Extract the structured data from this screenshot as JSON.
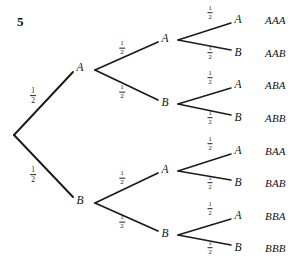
{
  "diagram": {
    "problem_number": "5",
    "type": "probability-tree",
    "branch_probability": {
      "numerator": "1",
      "denominator": "2"
    },
    "root": {
      "x": 14,
      "y": 135
    },
    "levels": [
      {
        "level": 1,
        "nodes": [
          {
            "id": "A",
            "label": "A",
            "x": 80,
            "y": 68,
            "vertex_x": 95,
            "vertex_y": 70,
            "prob_x": 33,
            "prob_y": 96,
            "frac_size": "frac-lg"
          },
          {
            "id": "B",
            "label": "B",
            "x": 80,
            "y": 201,
            "vertex_x": 95,
            "vertex_y": 203,
            "prob_x": 33,
            "prob_y": 175,
            "frac_size": "frac-lg"
          }
        ]
      },
      {
        "level": 2,
        "nodes": [
          {
            "id": "AA",
            "label": "A",
            "x": 165,
            "y": 39,
            "vertex_x": 178,
            "vertex_y": 40,
            "parent_x": 95,
            "parent_y": 70,
            "prob_x": 122,
            "prob_y": 48,
            "frac_size": "frac-md"
          },
          {
            "id": "AB",
            "label": "B",
            "x": 165,
            "y": 103,
            "vertex_x": 178,
            "vertex_y": 104,
            "parent_x": 95,
            "parent_y": 70,
            "prob_x": 122,
            "prob_y": 92,
            "frac_size": "frac-md"
          },
          {
            "id": "BA",
            "label": "A",
            "x": 165,
            "y": 170,
            "vertex_x": 178,
            "vertex_y": 171,
            "parent_x": 95,
            "parent_y": 203,
            "prob_x": 122,
            "prob_y": 178,
            "frac_size": "frac-md"
          },
          {
            "id": "BB",
            "label": "B",
            "x": 165,
            "y": 234,
            "vertex_x": 178,
            "vertex_y": 235,
            "parent_x": 95,
            "parent_y": 203,
            "prob_x": 122,
            "prob_y": 222,
            "frac_size": "frac-md"
          }
        ]
      },
      {
        "level": 3,
        "nodes": [
          {
            "id": "AAA",
            "label": "A",
            "x": 238,
            "y": 20,
            "parent_x": 178,
            "parent_y": 40,
            "prob_x": 210,
            "prob_y": 13,
            "frac_size": "frac-sm",
            "outcome": "AAA",
            "outcome_x": 265,
            "outcome_y": 20
          },
          {
            "id": "AAB",
            "label": "B",
            "x": 238,
            "y": 53,
            "parent_x": 178,
            "parent_y": 40,
            "prob_x": 210,
            "prob_y": 53,
            "frac_size": "frac-sm",
            "outcome": "AAB",
            "outcome_x": 265,
            "outcome_y": 53
          },
          {
            "id": "ABA",
            "label": "A",
            "x": 238,
            "y": 85,
            "parent_x": 178,
            "parent_y": 104,
            "prob_x": 210,
            "prob_y": 78,
            "frac_size": "frac-sm",
            "outcome": "ABA",
            "outcome_x": 265,
            "outcome_y": 85
          },
          {
            "id": "ABB",
            "label": "B",
            "x": 238,
            "y": 118,
            "parent_x": 178,
            "parent_y": 104,
            "prob_x": 210,
            "prob_y": 118,
            "frac_size": "frac-sm",
            "outcome": "ABB",
            "outcome_x": 265,
            "outcome_y": 118
          },
          {
            "id": "BAA",
            "label": "A",
            "x": 238,
            "y": 151,
            "parent_x": 178,
            "parent_y": 171,
            "prob_x": 210,
            "prob_y": 144,
            "frac_size": "frac-sm",
            "outcome": "BAA",
            "outcome_x": 265,
            "outcome_y": 151
          },
          {
            "id": "BAB",
            "label": "B",
            "x": 238,
            "y": 183,
            "parent_x": 178,
            "parent_y": 171,
            "prob_x": 210,
            "prob_y": 183,
            "frac_size": "frac-sm",
            "outcome": "BAB",
            "outcome_x": 265,
            "outcome_y": 183
          },
          {
            "id": "BBA",
            "label": "A",
            "x": 238,
            "y": 216,
            "parent_x": 178,
            "parent_y": 235,
            "prob_x": 210,
            "prob_y": 209,
            "frac_size": "frac-sm",
            "outcome": "BBA",
            "outcome_x": 265,
            "outcome_y": 216
          },
          {
            "id": "BBB",
            "label": "B",
            "x": 238,
            "y": 248,
            "parent_x": 178,
            "parent_y": 235,
            "prob_x": 210,
            "prob_y": 248,
            "frac_size": "frac-sm",
            "outcome": "BBB",
            "outcome_x": 265,
            "outcome_y": 248
          }
        ]
      }
    ],
    "colors": {
      "background": "#ffffff",
      "line": "#1a1a1a",
      "text": "#111111"
    }
  }
}
